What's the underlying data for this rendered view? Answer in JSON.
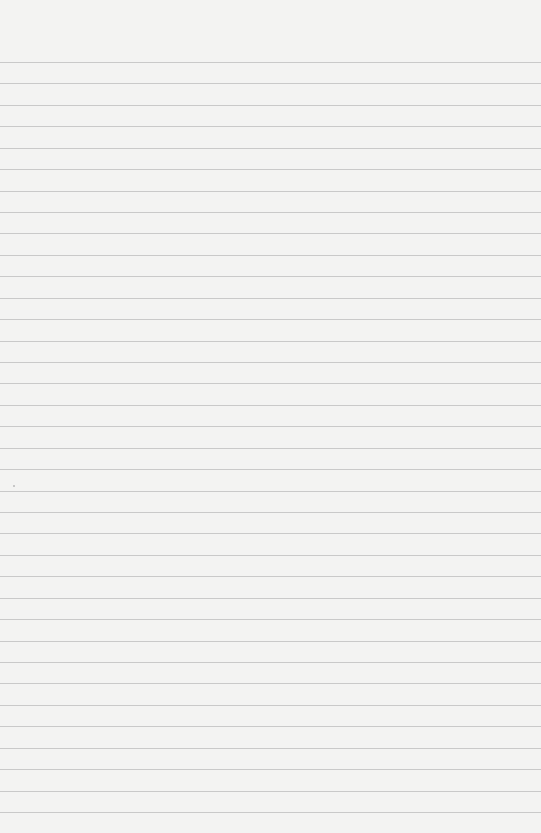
{
  "paper": {
    "type": "ruled-notebook-page",
    "line_color": "#c9c9c9",
    "background_color": "#f3f3f2",
    "first_line_y": 62,
    "line_spacing": 21.43,
    "line_count": 36
  }
}
